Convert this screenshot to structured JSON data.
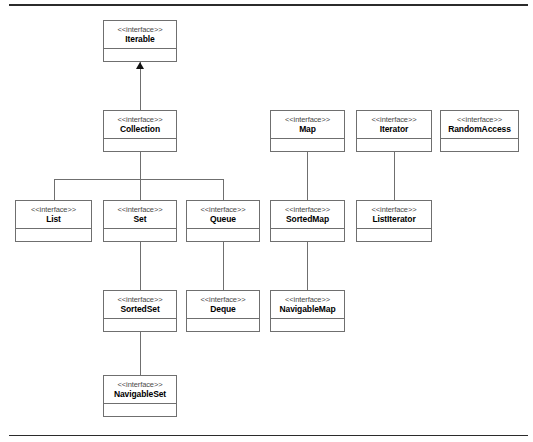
{
  "diagram": {
    "stereotype": "<<interface>>",
    "colors": {
      "background": "#ffffff",
      "box_border": "#6f6f6f",
      "connector": "#6f6f6f",
      "arrowhead": "#111111",
      "rule": "#2b2b2b",
      "name_text": "#000000",
      "stereotype_text": "#4a4a4a"
    },
    "rules": [
      {
        "id": "rule-top",
        "x": 9,
        "y": 4,
        "width": 519,
        "height": 2
      },
      {
        "id": "rule-bottom",
        "x": 9,
        "y": 435,
        "width": 519,
        "height": 1
      }
    ],
    "nodes": [
      {
        "id": "iterable",
        "name": "Iterable",
        "stereotype": "<<interface>>",
        "x": 103,
        "y": 20,
        "width": 74,
        "height": 42,
        "row": 1
      },
      {
        "id": "collection",
        "name": "Collection",
        "stereotype": "<<interface>>",
        "x": 103,
        "y": 110,
        "width": 74,
        "height": 42,
        "row": 2
      },
      {
        "id": "map",
        "name": "Map",
        "stereotype": "<<interface>>",
        "x": 270,
        "y": 110,
        "width": 75,
        "height": 42,
        "row": 2
      },
      {
        "id": "iterator",
        "name": "Iterator",
        "stereotype": "<<interface>>",
        "x": 356,
        "y": 110,
        "width": 76,
        "height": 42,
        "row": 2
      },
      {
        "id": "randomaccess",
        "name": "RandomAccess",
        "stereotype": "<<interface>>",
        "x": 440,
        "y": 110,
        "width": 79,
        "height": 42,
        "row": 2
      },
      {
        "id": "list",
        "name": "List",
        "stereotype": "<<interface>>",
        "x": 15,
        "y": 200,
        "width": 77,
        "height": 42,
        "row": 3
      },
      {
        "id": "set",
        "name": "Set",
        "stereotype": "<<interface>>",
        "x": 103,
        "y": 200,
        "width": 74,
        "height": 42,
        "row": 3
      },
      {
        "id": "queue",
        "name": "Queue",
        "stereotype": "<<interface>>",
        "x": 186,
        "y": 200,
        "width": 74,
        "height": 42,
        "row": 3
      },
      {
        "id": "sortedmap",
        "name": "SortedMap",
        "stereotype": "<<interface>>",
        "x": 270,
        "y": 200,
        "width": 75,
        "height": 42,
        "row": 3
      },
      {
        "id": "listiterator",
        "name": "ListIterator",
        "stereotype": "<<interface>>",
        "x": 356,
        "y": 200,
        "width": 76,
        "height": 42,
        "row": 3
      },
      {
        "id": "sortedset",
        "name": "SortedSet",
        "stereotype": "<<interface>>",
        "x": 103,
        "y": 290,
        "width": 74,
        "height": 42,
        "row": 4
      },
      {
        "id": "deque",
        "name": "Deque",
        "stereotype": "<<interface>>",
        "x": 186,
        "y": 290,
        "width": 74,
        "height": 42,
        "row": 4
      },
      {
        "id": "navigablemap",
        "name": "NavigableMap",
        "stereotype": "<<interface>>",
        "x": 270,
        "y": 290,
        "width": 75,
        "height": 42,
        "row": 4
      },
      {
        "id": "navigableset",
        "name": "NavigableSet",
        "stereotype": "<<interface>>",
        "x": 103,
        "y": 375,
        "width": 74,
        "height": 42,
        "row": 5
      }
    ],
    "edges": [
      {
        "id": "collection-to-iterable",
        "from": "collection",
        "to": "iterable",
        "kind": "generalization"
      },
      {
        "id": "list-to-collection",
        "from": "list",
        "to": "collection",
        "kind": "generalization"
      },
      {
        "id": "set-to-collection",
        "from": "set",
        "to": "collection",
        "kind": "generalization"
      },
      {
        "id": "queue-to-collection",
        "from": "queue",
        "to": "collection",
        "kind": "generalization"
      },
      {
        "id": "sortedmap-to-map",
        "from": "sortedmap",
        "to": "map",
        "kind": "generalization"
      },
      {
        "id": "listiterator-to-iterator",
        "from": "listiterator",
        "to": "iterator",
        "kind": "generalization"
      },
      {
        "id": "sortedset-to-set",
        "from": "sortedset",
        "to": "set",
        "kind": "generalization"
      },
      {
        "id": "deque-to-queue",
        "from": "deque",
        "to": "queue",
        "kind": "generalization"
      },
      {
        "id": "navigablemap-to-sortedmap",
        "from": "navigablemap",
        "to": "sortedmap",
        "kind": "generalization"
      },
      {
        "id": "navigableset-to-sortedset",
        "from": "navigableset",
        "to": "sortedset",
        "kind": "generalization"
      }
    ]
  }
}
